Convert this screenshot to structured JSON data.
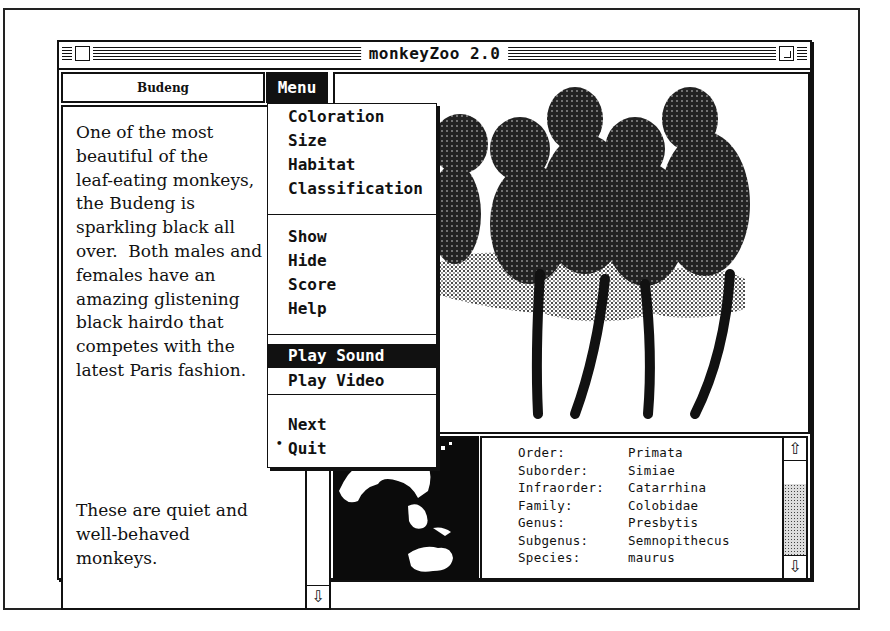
{
  "window": {
    "title": "monkeyZoo 2.0"
  },
  "animal": {
    "name": "Budeng",
    "description_lines": [
      "One of the most",
      "beautiful of the",
      "leaf-eating monkeys,",
      "the Budeng is",
      "sparkling black all",
      "over.  Both males and",
      "females have an",
      "amazing glistening",
      "black hairdo that",
      "competes with the",
      "latest Paris fashion."
    ],
    "note_lines": [
      "These are quiet and",
      "well-behaved",
      "monkeys."
    ]
  },
  "menu": {
    "title": "Menu",
    "groups": [
      [
        "Coloration",
        "Size",
        "Habitat",
        "Classification"
      ],
      [
        "Show",
        "Hide",
        "Score",
        "Help"
      ],
      [
        "Play Sound",
        "Play Video"
      ],
      [
        "Next",
        "Quit"
      ]
    ],
    "highlighted": "Play Sound",
    "marked_item": "Quit",
    "mark_glyph": "•"
  },
  "classification": [
    {
      "rank": "Order:",
      "value": "Primata"
    },
    {
      "rank": "Suborder:",
      "value": "Simiae"
    },
    {
      "rank": "Infraorder:",
      "value": "Catarrhina"
    },
    {
      "rank": "Family:",
      "value": "Colobidae"
    },
    {
      "rank": "Genus:",
      "value": "Presbytis"
    },
    {
      "rank": "Subgenus:",
      "value": "Semnopithecus"
    },
    {
      "rank": "Species:",
      "value": "maurus"
    }
  ],
  "icons": {
    "scroll_up": "⇧",
    "scroll_down": "⇩"
  },
  "images": {
    "main": "monkey-group-illustration",
    "map": "southeast-asia-map"
  }
}
